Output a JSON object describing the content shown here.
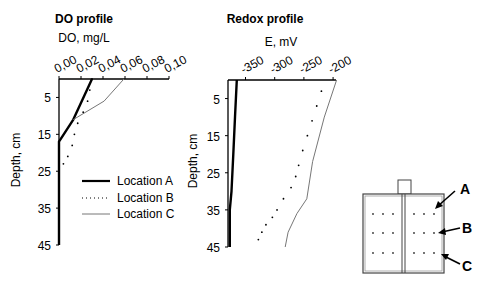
{
  "chart_data": [
    {
      "type": "line",
      "title": "DO profile",
      "xlabel": "DO, mg/L",
      "ylabel": "Depth, cm",
      "x_ticks": [
        "0,00",
        "0,02",
        "0,04",
        "0,06",
        "0,08",
        "0,10"
      ],
      "x_tick_values": [
        0.0,
        0.02,
        0.04,
        0.06,
        0.08,
        0.1
      ],
      "y_ticks": [
        "5",
        "15",
        "25",
        "35",
        "45"
      ],
      "y_tick_values": [
        5,
        15,
        25,
        35,
        45
      ],
      "xlim": [
        0.0,
        0.1
      ],
      "ylim": [
        0,
        45
      ],
      "y_inverted": true,
      "x_axis_position": "top",
      "grid": false,
      "series": [
        {
          "name": "Location A",
          "style": "solid-thick",
          "points": [
            [
              0.03,
              0
            ],
            [
              0.013,
              11
            ],
            [
              0.0,
              17
            ],
            [
              0.0,
              45
            ]
          ]
        },
        {
          "name": "Location B",
          "style": "dotted",
          "points": [
            [
              0.03,
              0
            ],
            [
              0.028,
              3
            ],
            [
              0.026,
              6
            ],
            [
              0.022,
              9
            ],
            [
              0.017,
              12
            ],
            [
              0.014,
              15
            ],
            [
              0.012,
              18
            ],
            [
              0.008,
              21
            ],
            [
              0.004,
              23
            ],
            [
              0.0,
              25
            ]
          ]
        },
        {
          "name": "Location C",
          "style": "solid-thin",
          "points": [
            [
              0.059,
              0
            ],
            [
              0.041,
              6
            ],
            [
              0.013,
              11
            ]
          ]
        }
      ],
      "legend": {
        "position": "lower-right",
        "entries": [
          "Location A",
          "Location B",
          "Location C"
        ]
      }
    },
    {
      "type": "line",
      "title": "Redox profile",
      "xlabel": "E, mV",
      "ylabel": "Depth, cm",
      "x_ticks": [
        "-350",
        "-300",
        "-250",
        "-200"
      ],
      "x_tick_values": [
        -350,
        -300,
        -250,
        -200
      ],
      "y_ticks": [
        "5",
        "15",
        "25",
        "35",
        "45"
      ],
      "y_tick_values": [
        5,
        15,
        25,
        35,
        45
      ],
      "xlim": [
        -380,
        -195
      ],
      "ylim": [
        0,
        45
      ],
      "y_inverted": true,
      "x_axis_position": "top",
      "grid": false,
      "series": [
        {
          "name": "Location A",
          "style": "solid-thick",
          "points": [
            [
              -365,
              0
            ],
            [
              -368,
              10
            ],
            [
              -371,
              20
            ],
            [
              -374,
              30
            ],
            [
              -377,
              35
            ],
            [
              -377,
              45
            ]
          ]
        },
        {
          "name": "Location B",
          "style": "dotted",
          "points": [
            [
              -220,
              3
            ],
            [
              -228,
              7
            ],
            [
              -236,
              11
            ],
            [
              -244,
              15
            ],
            [
              -252,
              19
            ],
            [
              -259,
              23
            ],
            [
              -266,
              27
            ],
            [
              -273,
              31
            ],
            [
              -285,
              23
            ],
            [
              -290,
              24
            ],
            [
              -300,
              27
            ],
            [
              -308,
              30
            ],
            [
              -315,
              33
            ],
            [
              -320,
              36
            ],
            [
              -323,
              38
            ],
            [
              -327,
              41
            ],
            [
              -328,
              43
            ]
          ]
        },
        {
          "name": "Location C",
          "style": "solid-thin",
          "points": [
            [
              -194,
              0
            ],
            [
              -215,
              10
            ],
            [
              -235,
              22
            ],
            [
              -245,
              32
            ],
            [
              -262,
              36
            ],
            [
              -277,
              41
            ],
            [
              -282,
              45
            ]
          ]
        }
      ]
    }
  ],
  "inset": {
    "labels": [
      "A",
      "B",
      "C"
    ]
  }
}
